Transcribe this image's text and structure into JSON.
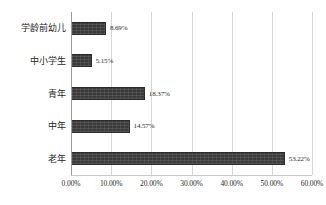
{
  "chart_data": {
    "type": "bar",
    "orientation": "horizontal",
    "title": "",
    "subtitle": "",
    "xlabel": "",
    "ylabel": "",
    "xlim": [
      0,
      60
    ],
    "grid": "vertical",
    "legend": "none",
    "bar_color": "#3b3b3b",
    "categories": [
      "学龄前幼儿",
      "中小学生",
      "青年",
      "中年",
      "老年"
    ],
    "values": [
      8.69,
      5.15,
      18.37,
      14.57,
      53.22
    ],
    "data_labels": [
      "8.69%",
      "5.15%",
      "18.37%",
      "14.57%",
      "53.22%"
    ],
    "xticks": [
      0,
      10,
      20,
      30,
      40,
      50,
      60
    ],
    "xtick_labels": [
      "0.00%",
      "10.00%",
      "20.00%",
      "30.00%",
      "40.00%",
      "50.00%",
      "60.00%"
    ]
  }
}
